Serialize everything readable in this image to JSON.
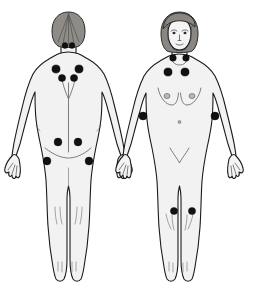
{
  "diagram": {
    "background_color": "#ffffff",
    "body_fill_color": "#f2f2f2",
    "outline_color": "#1a1a1a",
    "hair_color": "#8f8c88",
    "point_color": "#111111",
    "point_count": 18,
    "views": [
      {
        "id": "posterior",
        "label": "Back view",
        "side": "left"
      },
      {
        "id": "anterior",
        "label": "Front view",
        "side": "right"
      }
    ]
  },
  "tender_points": {
    "posterior": [
      {
        "name": "occiput-left",
        "label": "Occiput (left)",
        "cx": 65,
        "cy": 45.5,
        "r": 2.9
      },
      {
        "name": "occiput-right",
        "label": "Occiput (right)",
        "cx": 72,
        "cy": 45.5,
        "r": 2.9
      },
      {
        "name": "trapezius-left",
        "label": "Upper trapezius (left)",
        "cx": 56,
        "cy": 69,
        "r": 4.1
      },
      {
        "name": "trapezius-right",
        "label": "Upper trapezius (right)",
        "cx": 79,
        "cy": 69,
        "r": 4.1
      },
      {
        "name": "supraspinatus-left",
        "label": "Supraspinatus (left)",
        "cx": 62,
        "cy": 78,
        "r": 3.6
      },
      {
        "name": "supraspinatus-right",
        "label": "Supraspinatus (right)",
        "cx": 74,
        "cy": 78,
        "r": 3.6
      },
      {
        "name": "gluteal-left",
        "label": "Gluteal (left)",
        "cx": 58,
        "cy": 142,
        "r": 3.9
      },
      {
        "name": "gluteal-right",
        "label": "Gluteal (right)",
        "cx": 78,
        "cy": 142,
        "r": 3.9
      },
      {
        "name": "greater-trochanter-left",
        "label": "Greater trochanter (left)",
        "cx": 47,
        "cy": 161,
        "r": 3.9
      },
      {
        "name": "greater-trochanter-right",
        "label": "Greater trochanter (right)",
        "cx": 89,
        "cy": 161,
        "r": 3.9
      }
    ],
    "anterior": [
      {
        "name": "low-cervical-left",
        "label": "Low cervical (left)",
        "cx": 173,
        "cy": 58,
        "r": 3.3
      },
      {
        "name": "low-cervical-right",
        "label": "Low cervical (right)",
        "cx": 186,
        "cy": 58,
        "r": 3.3
      },
      {
        "name": "second-rib-left",
        "label": "Second rib (left)",
        "cx": 168,
        "cy": 72,
        "r": 4.1
      },
      {
        "name": "second-rib-right",
        "label": "Second rib (right)",
        "cx": 185,
        "cy": 72,
        "r": 4.1
      },
      {
        "name": "lateral-epicondyle-left",
        "label": "Lateral epicondyle (left)",
        "cx": 143,
        "cy": 116,
        "r": 4.0
      },
      {
        "name": "lateral-epicondyle-right",
        "label": "Lateral epicondyle (right)",
        "cx": 215,
        "cy": 116,
        "r": 4.0
      },
      {
        "name": "medial-knee-left",
        "label": "Medial knee (left)",
        "cx": 174,
        "cy": 211,
        "r": 3.6
      },
      {
        "name": "medial-knee-right",
        "label": "Medial knee (right)",
        "cx": 192,
        "cy": 211,
        "r": 3.6
      }
    ]
  }
}
